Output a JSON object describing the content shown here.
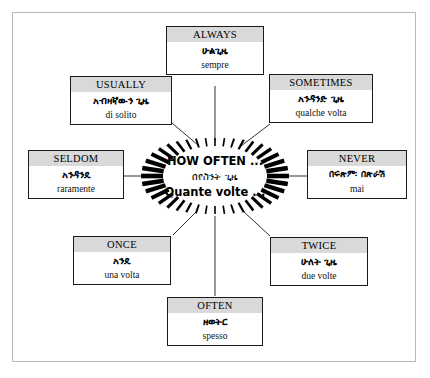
{
  "diagram": {
    "title_center": {
      "english": "HOW OFTEN ...",
      "amharic": "በየስንት ጊዜ",
      "italian": "Quante volte ..."
    },
    "nodes": [
      {
        "id": "always",
        "english": "ALWAYS",
        "amharic": "ሁልጊዜ",
        "italian": "sempre"
      },
      {
        "id": "usually",
        "english": "USUALLY",
        "amharic": "አብዛኛውን ጊዜ",
        "italian": "di solito"
      },
      {
        "id": "sometimes",
        "english": "SOMETIMES",
        "amharic": "አንዳንድ ጊዜ",
        "italian": "qualche volta"
      },
      {
        "id": "seldom",
        "english": "SELDOM",
        "amharic": "አንዳንዴ",
        "italian": "raramente"
      },
      {
        "id": "never",
        "english": "NEVER",
        "amharic": "በፍጽም፡ በጽራሽ",
        "italian": "mai"
      },
      {
        "id": "once",
        "english": "ONCE",
        "amharic": "አንዴ",
        "italian": "una volta"
      },
      {
        "id": "twice",
        "english": "TWICE",
        "amharic": "ሁለት ጊዜ",
        "italian": "due volte"
      },
      {
        "id": "often",
        "english": "OFTEN",
        "amharic": "ዘወትር",
        "italian": "spesso"
      }
    ],
    "colors": {
      "header_band": "#d9d9d9",
      "border": "#1a1a1a",
      "frame": "#b9b9b9",
      "background": "#ffffff",
      "ink": "#000000"
    }
  }
}
